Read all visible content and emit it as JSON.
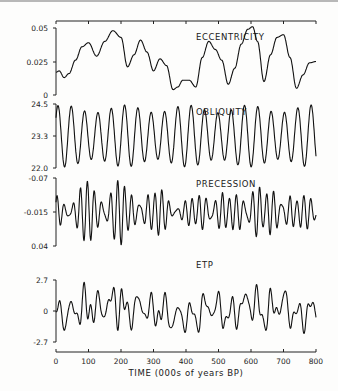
{
  "chart_data": {
    "type": "line",
    "title": "",
    "xlabel": "TIME (000s of years BP)",
    "xlim": [
      0,
      800
    ],
    "xticks": [
      "0",
      "100",
      "200",
      "300",
      "400",
      "500",
      "600",
      "700",
      "800"
    ],
    "panels": [
      {
        "name": "ECCENTRICITY",
        "yticks": [
          "0.05",
          "0.025",
          "0"
        ],
        "ylim": [
          0,
          0.05
        ],
        "x": [
          0,
          10,
          25,
          40,
          60,
          80,
          100,
          125,
          150,
          175,
          200,
          220,
          240,
          260,
          280,
          300,
          320,
          340,
          360,
          375,
          390,
          410,
          430,
          450,
          470,
          490,
          510,
          530,
          550,
          570,
          590,
          605,
          620,
          640,
          660,
          680,
          700,
          720,
          740,
          760,
          780,
          800
        ],
        "values": [
          0.017,
          0.018,
          0.013,
          0.016,
          0.026,
          0.036,
          0.039,
          0.029,
          0.04,
          0.048,
          0.043,
          0.021,
          0.03,
          0.041,
          0.032,
          0.018,
          0.027,
          0.022,
          0.004,
          0.006,
          0.011,
          0.011,
          0.006,
          0.028,
          0.04,
          0.034,
          0.026,
          0.008,
          0.02,
          0.038,
          0.049,
          0.051,
          0.04,
          0.01,
          0.03,
          0.043,
          0.045,
          0.028,
          0.005,
          0.015,
          0.024,
          0.025
        ]
      },
      {
        "name": "OBLIQUITY",
        "yticks": [
          "24.5",
          "23.3",
          "22.0"
        ],
        "ylim": [
          22.0,
          24.5
        ],
        "period_kyr": 41,
        "center": 23.3,
        "amplitude_range": [
          0.6,
          1.2
        ]
      },
      {
        "name": "PRECESSION",
        "yticks": [
          "-0.07",
          "-0.015",
          "0.04"
        ],
        "ylim": [
          -0.07,
          0.04
        ],
        "y_inverted": true,
        "period_kyr": [
          19,
          23
        ],
        "center": -0.015,
        "amplitude_modulated_by": "ECCENTRICITY"
      },
      {
        "name": "ETP",
        "yticks": [
          "2.7",
          "0",
          "-2.7"
        ],
        "ylim": [
          -2.7,
          2.7
        ],
        "description": "Normalized sum of eccentricity, tilt and precession"
      }
    ],
    "grid": false,
    "legend": "none"
  }
}
